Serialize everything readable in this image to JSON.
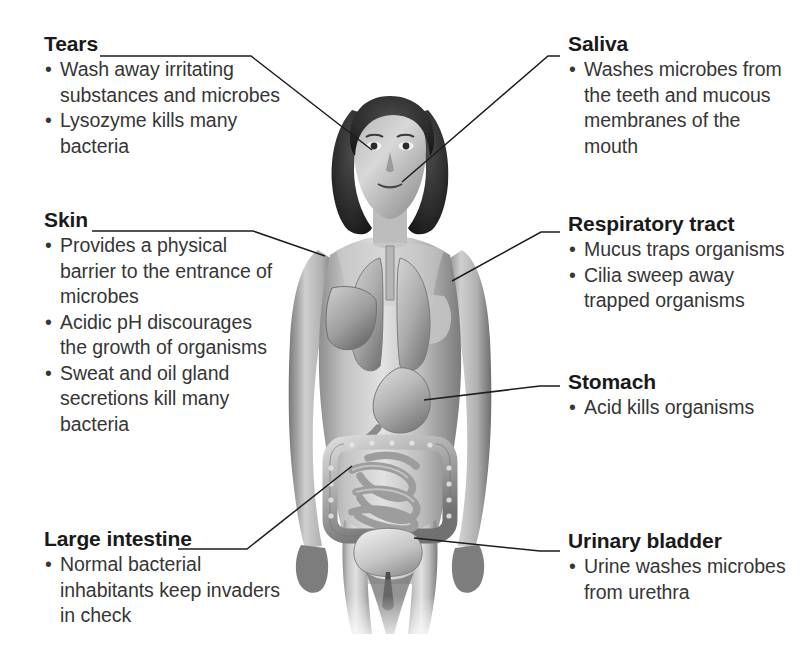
{
  "figure": {
    "caption_absent": true,
    "colors": {
      "heading": "#1a1a1a",
      "body_text": "#363636",
      "leader_line": "#1d1d1d",
      "background": "#ffffff",
      "skin_light": "#dcdcdc",
      "skin_mid": "#a8a8a8",
      "skin_dark": "#6e6e6e",
      "hair": "#2b2b2b",
      "organ_light": "#c9c9c9",
      "organ_mid": "#9a9a9a",
      "organ_dark": "#636363"
    },
    "organs": [
      "eye",
      "mouth",
      "lung-left",
      "lung-right",
      "liver",
      "stomach",
      "small-intestine",
      "large-intestine",
      "urinary-bladder",
      "trachea"
    ]
  },
  "callouts": [
    {
      "id": "tears",
      "title": "Tears",
      "bullets": [
        "Wash away irritating substances and microbes",
        "Lysozyme kills many bacteria"
      ]
    },
    {
      "id": "skin",
      "title": "Skin",
      "bullets": [
        "Provides a physical barrier to the entrance of microbes",
        "Acidic pH discourages the growth of organisms",
        "Sweat and oil gland secretions kill many bacteria"
      ]
    },
    {
      "id": "large-intestine",
      "title": "Large intestine",
      "bullets": [
        "Normal bacterial inhabitants keep invaders in check"
      ]
    },
    {
      "id": "saliva",
      "title": "Saliva",
      "bullets": [
        "Washes microbes from the teeth and mucous membranes of the mouth"
      ]
    },
    {
      "id": "respiratory-tract",
      "title": "Respiratory tract",
      "bullets": [
        "Mucus traps organisms",
        "Cilia sweep away trapped organisms"
      ]
    },
    {
      "id": "stomach",
      "title": "Stomach",
      "bullets": [
        "Acid kills organisms"
      ]
    },
    {
      "id": "urinary-bladder",
      "title": "Urinary bladder",
      "bullets": [
        "Urine washes microbes from urethra"
      ]
    }
  ],
  "bullet_glyph": "•"
}
